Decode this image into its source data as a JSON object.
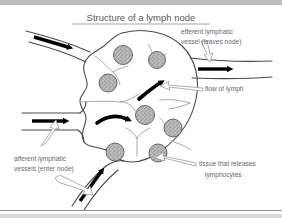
{
  "figure": {
    "title": "Structure of a lymph node",
    "title_underlined": true,
    "background_color": "#ffffff",
    "ink_color": "#4a484c",
    "text_color": "#6a686d",
    "arrow_color": "#000000",
    "follicle_fill": "#b9b9b9",
    "top_band_color": "#bdbdbd",
    "bottom_band_color": "#d8d8d8"
  },
  "labels": {
    "efferent": {
      "line1": "efferent lymphatic",
      "line2": "vessel (leaves node)"
    },
    "flow": {
      "line1": "flow of lymph"
    },
    "afferent": {
      "line1": "afferent lymphatic",
      "line2": "vessels (enter node)"
    },
    "tissue": {
      "line1": "tissue that releases",
      "line2": "lymphocytes"
    }
  },
  "diagram_parts": [
    {
      "name": "lymph-node-body",
      "description": "large rounded node outline"
    },
    {
      "name": "follicle",
      "description": "speckled lymphoid follicle",
      "count": 8
    },
    {
      "name": "afferent-vessel-top-left",
      "description": "vessel entering node upper left"
    },
    {
      "name": "afferent-vessel-mid-left",
      "description": "vessel entering node middle left"
    },
    {
      "name": "afferent-vessel-bottom",
      "description": "vessel entering node from below"
    },
    {
      "name": "efferent-vessel-right",
      "description": "vessel leaving node on the right"
    },
    {
      "name": "flow-arrow",
      "description": "black arrow showing lymph flow",
      "count": 6
    },
    {
      "name": "internal-sinus",
      "description": "branching internal channel"
    }
  ]
}
